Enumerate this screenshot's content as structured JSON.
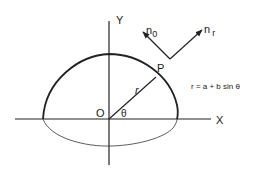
{
  "diagram": {
    "axes": {
      "x_label": "X",
      "y_label": "Y",
      "origin_label": "O"
    },
    "point_label": "P",
    "radius_label": "r",
    "angle_label": "θ",
    "vectors": {
      "n0": {
        "base": "n",
        "sub": "0"
      },
      "nr": {
        "base": "n",
        "sub": "r"
      }
    },
    "equation": "r = a + b sin θ",
    "colors": {
      "stroke": "#222222",
      "background": "#ffffff"
    }
  }
}
